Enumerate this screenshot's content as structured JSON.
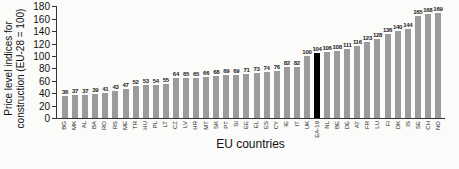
{
  "figure": {
    "y_axis_title_line1": "Price level indices for",
    "y_axis_title_line2": "construction (EU-28 = 100)",
    "x_axis_title": "EU countries"
  },
  "chart_data": {
    "type": "bar",
    "title": "Price level indices for construction (EU-28 = 100)",
    "xlabel": "EU countries",
    "ylabel": "Price level indices for construction (EU-28 = 100)",
    "ylim": [
      0,
      180
    ],
    "ytick_step": 20,
    "ytick_labels": [
      "0",
      "20",
      "40",
      "60",
      "80",
      "100",
      "120",
      "140",
      "160",
      "180"
    ],
    "grid": false,
    "legend": "none",
    "bar_color": "#9b9b9b",
    "highlight_color": "#000000",
    "highlight_category": "EA-19",
    "value_labels_shown": true,
    "categories": [
      "BG",
      "MK",
      "AL",
      "BA",
      "RO",
      "RS",
      "ME",
      "TR",
      "HU",
      "PL",
      "LT",
      "CZ",
      "LV",
      "HR",
      "MT",
      "SK",
      "PT",
      "SI",
      "EE",
      "EL",
      "ES",
      "CY",
      "IE",
      "IT",
      "UK",
      "EA-19",
      "NL",
      "BE",
      "DE",
      "AT",
      "FR",
      "LU",
      "FI",
      "DK",
      "IS",
      "SE",
      "CH",
      "NO"
    ],
    "values": [
      36,
      37,
      37,
      39,
      41,
      43,
      47,
      52,
      53,
      54,
      55,
      64,
      65,
      65,
      66,
      68,
      69,
      69,
      71,
      73,
      74,
      76,
      82,
      82,
      100,
      104,
      106,
      108,
      111,
      116,
      123,
      128,
      136,
      140,
      144,
      165,
      168,
      169
    ]
  }
}
